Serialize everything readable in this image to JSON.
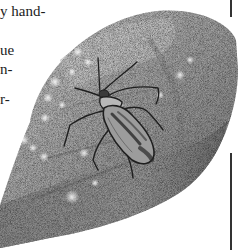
{
  "page": {
    "text_fragments": [
      {
        "text": "y hand-",
        "x": 0,
        "y": 4
      },
      {
        "text": "ue",
        "x": 0,
        "y": 43
      },
      {
        "text": "n-",
        "x": 0,
        "y": 62
      },
      {
        "text": "r-",
        "x": 0,
        "y": 92
      }
    ],
    "illustration": {
      "subject": "insect on leaf",
      "description": "Stippled grayscale drawing of a true bug (plant bug) resting on a large pale leaf with light spots"
    },
    "colors": {
      "background": "#ffffff",
      "text": "#1c1c1c",
      "leaf_dark": "#6e6e6e",
      "leaf_mid": "#9a9a9a",
      "leaf_light": "#c9c9c9",
      "insect": "#2a2a2a",
      "rule": "#333333"
    }
  }
}
